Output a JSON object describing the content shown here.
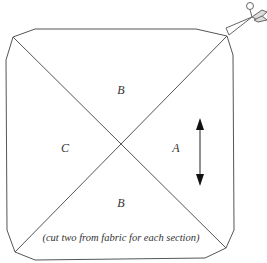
{
  "diagram": {
    "type": "sewing-pattern",
    "sections": {
      "top": "B",
      "left": "C",
      "right": "A",
      "bottom": "B"
    },
    "instruction": "(cut two from fabric for each section)",
    "icons": {
      "cut": "scissors-icon",
      "grain": "double-arrow-icon"
    },
    "colors": {
      "line": "#444444",
      "background": "#ffffff"
    }
  }
}
